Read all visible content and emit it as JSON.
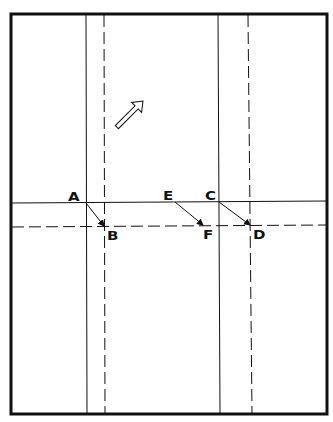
{
  "diagram": {
    "type": "fold-diagram",
    "colors": {
      "ink": "#111111",
      "background": "#ffffff"
    },
    "frame": {
      "x": 11,
      "y": 14,
      "width": 316,
      "height": 400,
      "stroke_width": 3
    },
    "folds": {
      "solid_vertical": [
        {
          "x1": 86,
          "y1": 15,
          "x2": 87,
          "y2": 413
        },
        {
          "x1": 218,
          "y1": 15,
          "x2": 220,
          "y2": 413
        }
      ],
      "dashed_vertical": [
        {
          "x1": 104,
          "y1": 15,
          "x2": 105,
          "y2": 413
        },
        {
          "x1": 248,
          "y1": 15,
          "x2": 252,
          "y2": 413
        }
      ],
      "solid_horizontal": [
        {
          "x1": 12,
          "y1": 203,
          "x2": 326,
          "y2": 201
        }
      ],
      "dashed_horizontal": [
        {
          "x1": 12,
          "y1": 227,
          "x2": 326,
          "y2": 225
        }
      ]
    },
    "move_arrows": [
      {
        "from": "A",
        "to": "B",
        "x1": 86,
        "y1": 203,
        "x2": 104,
        "y2": 226
      },
      {
        "from": "E",
        "to": "F",
        "x1": 175,
        "y1": 202,
        "x2": 203,
        "y2": 225
      },
      {
        "from": "C",
        "to": "D",
        "x1": 219,
        "y1": 202,
        "x2": 250,
        "y2": 225
      }
    ],
    "direction_arrow": {
      "icon": "hollow-arrow-up-left",
      "tip": {
        "x": 143,
        "y": 101
      },
      "tail": {
        "x": 171,
        "y": 127
      }
    },
    "labels": [
      {
        "id": "A",
        "text": "A",
        "x": 68,
        "y": 191
      },
      {
        "id": "B",
        "text": "B",
        "x": 107,
        "y": 230
      },
      {
        "id": "E",
        "text": "E",
        "x": 163,
        "y": 190
      },
      {
        "id": "F",
        "text": "F",
        "x": 203,
        "y": 229
      },
      {
        "id": "C",
        "text": "C",
        "x": 205,
        "y": 190
      },
      {
        "id": "D",
        "text": "D",
        "x": 253,
        "y": 229
      }
    ]
  }
}
